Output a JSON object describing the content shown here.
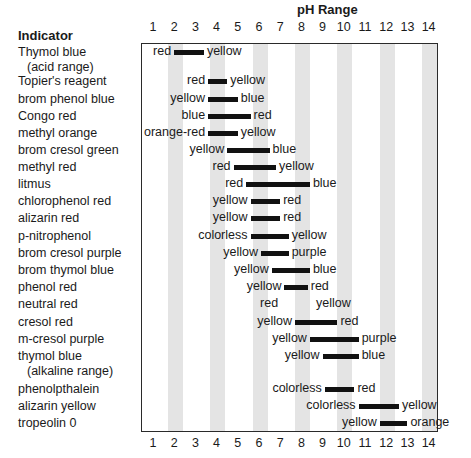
{
  "chart_data": {
    "type": "range-bar",
    "title": "pH Range",
    "xlabel": "pH Range",
    "ylabel": "Indicator",
    "x_ticks": [
      1,
      2,
      3,
      4,
      5,
      6,
      7,
      8,
      9,
      10,
      11,
      12,
      13,
      14
    ],
    "xlim": [
      0.4,
      14.4
    ],
    "shaded_columns": [
      2,
      4,
      6,
      8,
      10,
      12,
      14
    ],
    "grid": false,
    "legend": null,
    "indicators": [
      {
        "name": "Thymol blue",
        "sub": "(acid range)",
        "low_color": "red",
        "high_color": "yellow",
        "ph_low": 2.0,
        "ph_high": 3.4
      },
      {
        "name": "Topier's reagent",
        "low_color": "red",
        "high_color": "yellow",
        "ph_low": 3.6,
        "ph_high": 4.5
      },
      {
        "name": "brom phenol blue",
        "low_color": "yellow",
        "high_color": "blue",
        "ph_low": 3.6,
        "ph_high": 5.0
      },
      {
        "name": "Congo red",
        "low_color": "blue",
        "high_color": "red",
        "ph_low": 3.6,
        "ph_high": 5.6
      },
      {
        "name": "methyl orange",
        "low_color": "orange-red",
        "high_color": "yellow",
        "ph_low": 3.6,
        "ph_high": 5.0
      },
      {
        "name": "brom cresol green",
        "low_color": "yellow",
        "high_color": "blue",
        "ph_low": 4.5,
        "ph_high": 6.5
      },
      {
        "name": "methyl red",
        "low_color": "red",
        "high_color": "yellow",
        "ph_low": 4.8,
        "ph_high": 6.8
      },
      {
        "name": "litmus",
        "low_color": "red",
        "high_color": "blue",
        "ph_low": 5.4,
        "ph_high": 8.4
      },
      {
        "name": "chlorophenol red",
        "low_color": "yellow",
        "high_color": "red",
        "ph_low": 5.6,
        "ph_high": 7.0
      },
      {
        "name": "alizarin red",
        "low_color": "yellow",
        "high_color": "red",
        "ph_low": 5.6,
        "ph_high": 7.0
      },
      {
        "name": "p-nitrophenol",
        "low_color": "colorless",
        "high_color": "yellow",
        "ph_low": 5.6,
        "ph_high": 7.4
      },
      {
        "name": "brom cresol purple",
        "low_color": "yellow",
        "high_color": "purple",
        "ph_low": 6.1,
        "ph_high": 7.4
      },
      {
        "name": "brom thymol blue",
        "low_color": "yellow",
        "high_color": "blue",
        "ph_low": 6.6,
        "ph_high": 8.4
      },
      {
        "name": "phenol red",
        "low_color": "yellow",
        "high_color": "red",
        "ph_low": 7.2,
        "ph_high": 8.3
      },
      {
        "name": "neutral red",
        "low_color": "red",
        "high_color": "yellow",
        "ph_low": 7.0,
        "ph_high": 8.6,
        "no_bar": true
      },
      {
        "name": "cresol red",
        "low_color": "yellow",
        "high_color": "red",
        "ph_low": 7.7,
        "ph_high": 9.7
      },
      {
        "name": "m-cresol purple",
        "low_color": "yellow",
        "high_color": "purple",
        "ph_low": 8.4,
        "ph_high": 10.7
      },
      {
        "name": "thymol blue",
        "sub": "(alkaline range)",
        "low_color": "yellow",
        "high_color": "blue",
        "ph_low": 9.0,
        "ph_high": 10.7
      },
      {
        "name": "phenolpthalein",
        "low_color": "colorless",
        "high_color": "red",
        "ph_low": 9.1,
        "ph_high": 10.5
      },
      {
        "name": "alizarin yellow",
        "low_color": "colorless",
        "high_color": "yellow",
        "ph_low": 10.7,
        "ph_high": 12.6
      },
      {
        "name": "tropeolin 0",
        "low_color": "yellow",
        "high_color": "orange",
        "ph_low": 11.7,
        "ph_high": 13.0
      }
    ]
  },
  "header": {
    "title": "pH Range",
    "indicator_column": "Indicator"
  },
  "colors": {
    "bar": "#111111",
    "band": "#e4e4e4",
    "frame": "#2a2a2a"
  }
}
